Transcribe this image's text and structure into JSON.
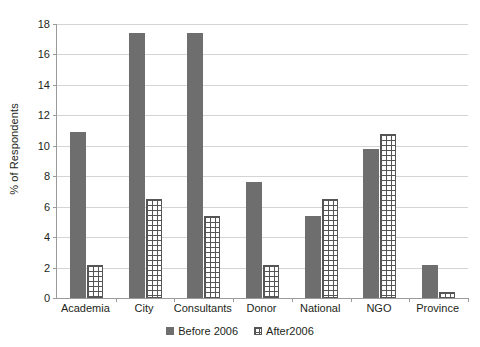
{
  "chart_data": {
    "type": "bar",
    "title": "",
    "xlabel": "",
    "ylabel": "% of Respondents",
    "ylim": [
      0,
      18
    ],
    "yticks": [
      0,
      2,
      4,
      6,
      8,
      10,
      12,
      14,
      16,
      18
    ],
    "grid": true,
    "legend_position": "bottom",
    "categories": [
      "Academia",
      "City",
      "Consultants",
      "Donor",
      "National",
      "NGO",
      "Province"
    ],
    "series": [
      {
        "name": "Before 2006",
        "color": "#6e6e6e",
        "pattern": "solid",
        "values": [
          10.9,
          17.4,
          17.4,
          7.6,
          5.4,
          9.8,
          2.2
        ]
      },
      {
        "name": "After2006",
        "color": "#ffffff",
        "pattern": "brick-hatch",
        "values": [
          2.2,
          6.5,
          5.4,
          2.2,
          6.5,
          10.8,
          0.4
        ]
      }
    ]
  },
  "axis": {
    "y_title": "% of Respondents",
    "y_tick_labels": [
      "0",
      "2",
      "4",
      "6",
      "8",
      "10",
      "12",
      "14",
      "16",
      "18"
    ],
    "x_tick_labels": [
      "Academia",
      "City",
      "Consultants",
      "Donor",
      "National",
      "NGO",
      "Province"
    ]
  },
  "legend": {
    "entries": [
      {
        "label": "Before 2006",
        "swatch": "solid-gray-swatch"
      },
      {
        "label": "After2006",
        "swatch": "hatched-white-swatch"
      }
    ]
  },
  "colors": {
    "series_before": "#6e6e6e",
    "series_after_fill": "#ffffff",
    "series_after_stroke": "#555555",
    "gridline": "#d4d4d4",
    "axis_line": "#9b9b9b",
    "text": "#231f20",
    "background": "#ffffff"
  }
}
